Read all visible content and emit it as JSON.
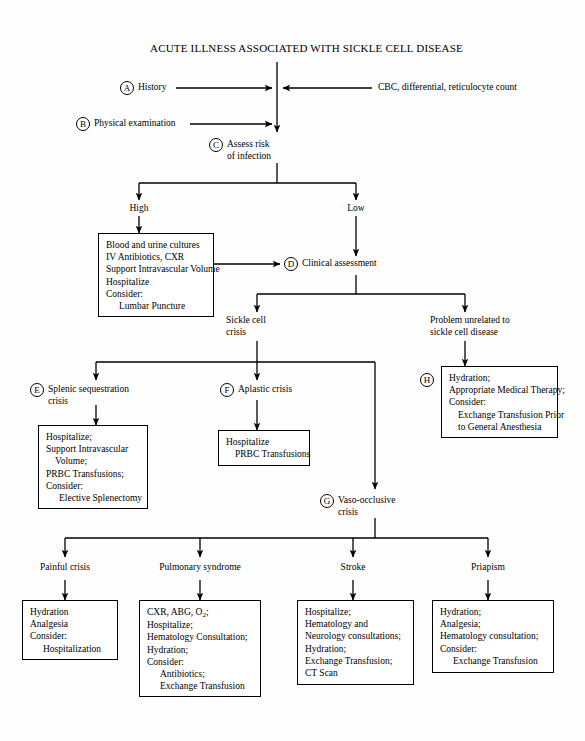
{
  "document": {
    "title": "ACUTE ILLNESS ASSOCIATED WITH SICKLE CELL DISEASE"
  },
  "inputs": {
    "history": {
      "tag": "A",
      "label": "History"
    },
    "physical": {
      "tag": "B",
      "label": "Physical examination"
    },
    "labs": {
      "label": "CBC, differential, reticulocyte count"
    }
  },
  "assess": {
    "tag": "C",
    "line1": "Assess risk",
    "line2": "of infection"
  },
  "risk": {
    "high_label": "High",
    "low_label": "Low"
  },
  "high_risk_box": {
    "lines": [
      "Blood and urine cultures",
      "IV Antibiotics, CXR",
      "Support Intravascular Volume",
      "Hospitalize",
      "Consider:",
      "Lumbar Puncture"
    ]
  },
  "clinical": {
    "tag": "D",
    "label": "Clinical assessment"
  },
  "crisis_branch": {
    "sickle_line1": "Sickle cell",
    "sickle_line2": "crisis",
    "unrelated_line1": "Problem unrelated to",
    "unrelated_line2": "sickle cell disease"
  },
  "unrelated_box": {
    "tag": "H",
    "lines": [
      "Hydration;",
      "Appropriate Medical Therapy;",
      "Consider:",
      "Exchange Transfusion Prior",
      "to General Anesthesia"
    ]
  },
  "splenic": {
    "tag": "E",
    "line1": "Splenic sequestration",
    "line2": "crisis",
    "box_lines": [
      "Hospitalize;",
      "Support Intravascular",
      "Volume;",
      "PRBC Transfusions;",
      "Consider:",
      "Elective Splenectomy"
    ]
  },
  "aplastic": {
    "tag": "F",
    "label": "Aplastic crisis",
    "box_lines": [
      "Hospitalize",
      "PRBC Transfusions"
    ]
  },
  "vaso": {
    "tag": "G",
    "line1": "Vaso-occlusive",
    "line2": "crisis"
  },
  "outcomes": [
    {
      "label": "Painful crisis",
      "box_lines": [
        "Hydration",
        "Analgesia",
        "Consider:",
        "Hospitalization"
      ]
    },
    {
      "label": "Pulmonary syndrome",
      "box_lines": [
        "CXR, ABG, O2;",
        "Hospitalize;",
        "Hematology Consultation;",
        "Hydration;",
        "Consider:",
        "Antibiotics;",
        "Exchange Transfusion"
      ]
    },
    {
      "label": "Stroke",
      "box_lines": [
        "Hospitalize;",
        "Hematology and",
        "Neurology consultations;",
        "Hydration;",
        "Exchange Transfusion;",
        "CT Scan"
      ]
    },
    {
      "label": "Priapism",
      "box_lines": [
        "Hydration;",
        "Analgesia;",
        "Hematology consultation;",
        "Consider:",
        "Exchange Transfusion"
      ]
    }
  ],
  "colors": {
    "line": "#000000",
    "background": "#ffffff",
    "text": "#000000"
  }
}
